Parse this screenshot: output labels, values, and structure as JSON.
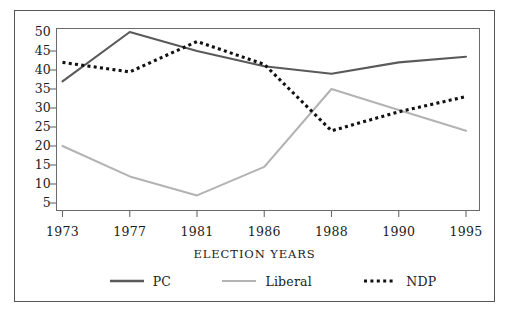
{
  "chart_data": {
    "type": "line",
    "title": "",
    "xlabel": "ELECTION YEARS",
    "ylabel": "",
    "categories": [
      "1973",
      "1977",
      "1981",
      "1986",
      "1988",
      "1990",
      "1995"
    ],
    "yticks": [
      5,
      10,
      15,
      20,
      25,
      30,
      35,
      40,
      45,
      50
    ],
    "ylim": [
      0,
      52
    ],
    "grid": false,
    "legend_position": "bottom",
    "series": [
      {
        "name": "PC",
        "color": "#5a5a5a",
        "style": "solid",
        "values": [
          37,
          50,
          45,
          41,
          39,
          42,
          43.5
        ]
      },
      {
        "name": "Liberal",
        "color": "#b3b3b3",
        "style": "solid",
        "values": [
          20,
          12,
          7,
          14.5,
          35,
          29.5,
          24
        ]
      },
      {
        "name": "NDP",
        "color": "#111111",
        "style": "dotted",
        "values": [
          42,
          39.5,
          47.5,
          41.5,
          24,
          29,
          33
        ]
      }
    ]
  },
  "colors": {
    "pc": "#5a5a5a",
    "liberal": "#b3b3b3",
    "ndp": "#111111",
    "axis": "#6a6a6a",
    "frame": "#555555",
    "text": "#1b1b1b",
    "background": "#ffffff"
  },
  "axes": {
    "x_title": "ELECTION YEARS",
    "y_tick_labels": [
      "50",
      "45",
      "40",
      "35",
      "30",
      "25",
      "20",
      "15",
      "10",
      "5"
    ],
    "x_tick_labels": [
      "1973",
      "1977",
      "1981",
      "1986",
      "1988",
      "1990",
      "1995"
    ]
  },
  "legend": {
    "items": [
      {
        "label": "PC",
        "swatch": "solid-line-dark-swatch"
      },
      {
        "label": "Liberal",
        "swatch": "solid-line-gray-swatch"
      },
      {
        "label": "NDP",
        "swatch": "dotted-line-black-swatch"
      }
    ]
  }
}
